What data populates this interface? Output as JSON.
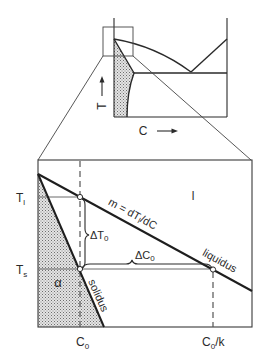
{
  "overview": {
    "t_axis_label": "T",
    "c_axis_label": "C"
  },
  "detail": {
    "t_liquidus": {
      "main": "T",
      "sub": "l"
    },
    "t_solidus": {
      "main": "T",
      "sub": "s"
    },
    "slope": {
      "pre": "m = dT",
      "sub": "l",
      "post": "/dC"
    },
    "liquid_phase": "l",
    "delta_t0": {
      "main": "ΔT",
      "sub": "0"
    },
    "delta_c0": {
      "main": "ΔC",
      "sub": "0"
    },
    "liquidus_label": "liquidus",
    "solidus_label": "solidus",
    "alpha_phase": "α",
    "c0": {
      "main": "C",
      "sub": "0"
    },
    "c0_over_k": {
      "main": "C",
      "sub": "0",
      "post": "/k"
    }
  },
  "colors": {
    "line": "#1e1e1e",
    "thin_line": "#6a6a6a",
    "stipple_fill": "#b8b8b8",
    "background": "#ffffff"
  }
}
